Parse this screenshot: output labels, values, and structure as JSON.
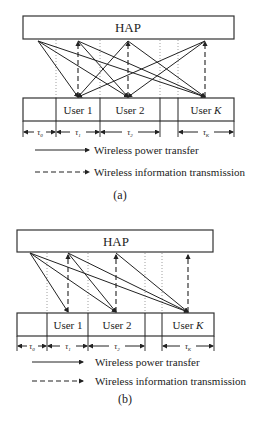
{
  "figure_a": {
    "hap_label": "HAP",
    "users": [
      "User 1",
      "User 2",
      "User K"
    ],
    "user_k_prefix": "User ",
    "user_k_italic": "K",
    "taus": [
      "τ0",
      "τ1",
      "τ2",
      "τK"
    ],
    "tau_base": "τ",
    "tau_subs": [
      "0",
      "1",
      "2",
      "K"
    ],
    "legend": {
      "solid": "Wireless power transfer",
      "dashed": "Wireless information transmission"
    },
    "caption": "(a)"
  },
  "figure_b": {
    "hap_label": "HAP",
    "users": [
      "User 1",
      "User 2",
      "User K"
    ],
    "user_k_prefix": "User ",
    "user_k_italic": "K",
    "taus": [
      "τ0",
      "τ1",
      "τ2",
      "τK"
    ],
    "tau_base": "τ",
    "tau_subs": [
      "0",
      "1",
      "2",
      "K"
    ],
    "legend": {
      "solid": "Wireless power transfer",
      "dashed": "Wireless information transmission"
    },
    "caption": "(b)"
  },
  "colors": {
    "stroke": "#222222",
    "background": "#ffffff"
  }
}
